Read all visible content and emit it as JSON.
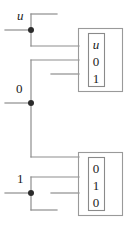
{
  "diagram": {
    "type": "circuit-tape-diagram",
    "signal_labels": [
      {
        "name": "input-u",
        "text": "u",
        "italic": true,
        "x": 17,
        "y": 9
      },
      {
        "name": "input-zero",
        "text": "0",
        "italic": false,
        "x": 16,
        "y": 82
      },
      {
        "name": "input-one",
        "text": "1",
        "italic": false,
        "x": 17,
        "y": 172
      }
    ],
    "blocks": [
      {
        "name": "upper-block",
        "cells": [
          {
            "text": "u",
            "italic": true
          },
          {
            "text": "0",
            "italic": false
          },
          {
            "text": "1",
            "italic": false
          }
        ]
      },
      {
        "name": "lower-block",
        "cells": [
          {
            "text": "0",
            "italic": false
          },
          {
            "text": "1",
            "italic": false
          },
          {
            "text": "0",
            "italic": false
          }
        ]
      }
    ],
    "colors": {
      "wire": "#8e8e8e",
      "junction": "#2b2b2b",
      "box_outline": "#9a9a9a",
      "text": "#1a1a1a",
      "background": "#ffffff"
    }
  }
}
